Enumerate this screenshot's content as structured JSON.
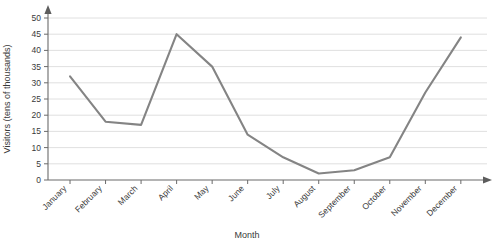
{
  "chart_data": {
    "type": "line",
    "title": "",
    "subtitle": "",
    "xlabel": "Month",
    "ylabel": "Visitors (tens of thousands)",
    "categories": [
      "January",
      "February",
      "March",
      "April",
      "May",
      "June",
      "July",
      "August",
      "September",
      "October",
      "November",
      "December"
    ],
    "values": [
      32,
      18,
      17,
      45,
      35,
      14,
      7,
      2,
      3,
      7,
      27,
      44
    ],
    "series": [
      {
        "name": "Visitors",
        "values": [
          32,
          18,
          17,
          45,
          35,
          14,
          7,
          2,
          3,
          7,
          27,
          44
        ]
      }
    ],
    "ylim": [
      0,
      50
    ],
    "ytick_labels": [
      "0",
      "5",
      "10",
      "15",
      "20",
      "25",
      "30",
      "35",
      "40",
      "45",
      "50"
    ],
    "ytick_values": [
      0,
      5,
      10,
      15,
      20,
      25,
      30,
      35,
      40,
      45,
      50
    ],
    "grid": true,
    "legend": false,
    "legend_position": "none",
    "annotations": [],
    "colors": {
      "line": "#848484",
      "grid": "#d8d8d8",
      "axis": "#6b6b6b",
      "text": "#3a3a3a",
      "background": "#ffffff"
    },
    "axis_arrows": {
      "x_axis_arrow": "arrow-right",
      "y_axis_arrow": "arrow-up"
    }
  }
}
